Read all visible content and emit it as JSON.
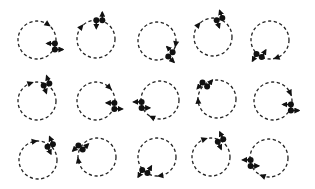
{
  "diagram": {
    "rows": 3,
    "cols": 5,
    "colors": {
      "stroke": "#222222",
      "fill": "#111111",
      "background": "#ffffff"
    },
    "circle_radius": 19,
    "cells": [
      {
        "cx": 37,
        "cy": 40,
        "dipole_angle": 20,
        "dipole_axis": 0,
        "marker_angle": -55
      },
      {
        "cx": 96,
        "cy": 39,
        "dipole_angle": -80,
        "dipole_axis": 90,
        "marker_angle": -140
      },
      {
        "cx": 157,
        "cy": 41,
        "dipole_angle": 45,
        "dipole_axis": 45,
        "marker_angle": 10
      },
      {
        "cx": 213,
        "cy": 37,
        "dipole_angle": -70,
        "dipole_axis": 70,
        "marker_angle": -140
      },
      {
        "cx": 270,
        "cy": 40,
        "dipole_angle": 125,
        "dipole_axis": -60,
        "marker_angle": 70
      },
      {
        "cx": 37,
        "cy": 101,
        "dipole_angle": -60,
        "dipole_axis": 70,
        "marker_angle": -110
      },
      {
        "cx": 96,
        "cy": 101,
        "dipole_angle": 15,
        "dipole_axis": 0,
        "marker_angle": -45
      },
      {
        "cx": 160,
        "cy": 100,
        "dipole_angle": 165,
        "dipole_axis": 0,
        "marker_angle": 115
      },
      {
        "cx": 217,
        "cy": 99,
        "dipole_angle": -130,
        "dipole_axis": -50,
        "marker_angle": 175
      },
      {
        "cx": 273,
        "cy": 101,
        "dipole_angle": 20,
        "dipole_axis": 0,
        "marker_angle": -25
      },
      {
        "cx": 38,
        "cy": 160,
        "dipole_angle": -50,
        "dipole_axis": 65,
        "marker_angle": -100
      },
      {
        "cx": 97,
        "cy": 157,
        "dipole_angle": -150,
        "dipole_axis": -45,
        "marker_angle": 170
      },
      {
        "cx": 157,
        "cy": 157,
        "dipole_angle": 130,
        "dipole_axis": -60,
        "marker_angle": 80
      },
      {
        "cx": 211,
        "cy": 157,
        "dipole_angle": -60,
        "dipole_axis": 65,
        "marker_angle": -110
      },
      {
        "cx": 269,
        "cy": 158,
        "dipole_angle": 165,
        "dipole_axis": 0,
        "marker_angle": 110
      }
    ]
  }
}
